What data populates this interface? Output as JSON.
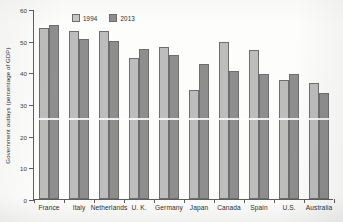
{
  "chart_data": {
    "type": "bar",
    "title": "",
    "xlabel": "",
    "ylabel": "Government outlays (percentage of GDP)",
    "ylim": [
      0,
      60
    ],
    "yticks": [
      0,
      10,
      20,
      30,
      40,
      50,
      60
    ],
    "grid": false,
    "legend_position": "top-left-inside",
    "categories": [
      "France",
      "Italy",
      "Netherlands",
      "U. K.",
      "Germany",
      "Japan",
      "Canada",
      "Spain",
      "U.S.",
      "Australia"
    ],
    "series": [
      {
        "name": "1994",
        "color": "#bdbdbd",
        "values": [
          54.0,
          53.0,
          53.0,
          44.5,
          48.0,
          34.5,
          49.5,
          47.0,
          37.5,
          36.5
        ]
      },
      {
        "name": "2013",
        "color": "#8e8e8e",
        "values": [
          55.0,
          50.5,
          50.0,
          47.5,
          45.5,
          42.5,
          40.5,
          39.5,
          39.5,
          33.5
        ]
      }
    ]
  },
  "legend": {
    "items": [
      {
        "label": "1994",
        "swatch": "legend-swatch-1994"
      },
      {
        "label": "2013",
        "swatch": "legend-swatch-2013"
      }
    ]
  },
  "axes": {
    "y_title": "Government outlays (percentage of GDP)",
    "y_tick_labels": [
      "0",
      "10",
      "20",
      "30",
      "40",
      "50",
      "60"
    ]
  }
}
